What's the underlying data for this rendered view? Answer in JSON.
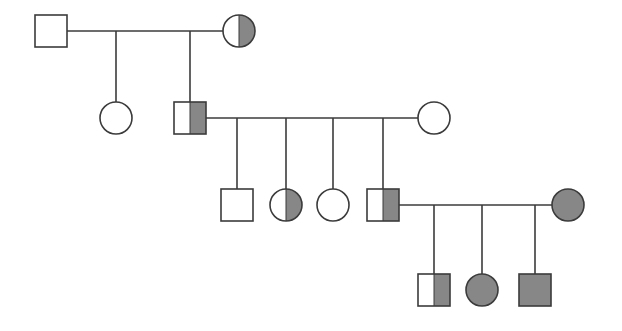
{
  "figure": {
    "kind": "pedigree-chart",
    "width": 622,
    "height": 331,
    "background_color": "#ffffff",
    "line_color": "#3b3b3b",
    "line_width": 1.6,
    "fill_color": "#878787",
    "unaffected_fill": "#ffffff"
  },
  "legend_semantics": {
    "square": "male",
    "circle": "female",
    "unfilled": "unaffected",
    "half_filled_right": "carrier / heterozygous",
    "fully_filled": "affected"
  },
  "generations": [
    {
      "id": "I",
      "symbol_y": 31,
      "members": [
        {
          "id": "I-1",
          "shape": "square",
          "fill": "none",
          "cx": 51,
          "cy": 31,
          "size": 32,
          "label": "unaffected-male"
        },
        {
          "id": "I-2",
          "shape": "circle",
          "fill": "half-right",
          "cx": 239,
          "cy": 31,
          "size": 32,
          "label": "carrier-female"
        }
      ]
    },
    {
      "id": "II",
      "symbol_y": 118,
      "members": [
        {
          "id": "II-1",
          "shape": "circle",
          "fill": "none",
          "cx": 116,
          "cy": 118,
          "size": 32,
          "label": "unaffected-female"
        },
        {
          "id": "II-2",
          "shape": "square",
          "fill": "half-right",
          "cx": 190,
          "cy": 118,
          "size": 32,
          "label": "carrier-male"
        },
        {
          "id": "II-3",
          "shape": "circle",
          "fill": "none",
          "cx": 434,
          "cy": 118,
          "size": 32,
          "label": "unaffected-female"
        }
      ]
    },
    {
      "id": "III",
      "symbol_y": 205,
      "members": [
        {
          "id": "III-1",
          "shape": "square",
          "fill": "none",
          "cx": 237,
          "cy": 205,
          "size": 32,
          "label": "unaffected-male"
        },
        {
          "id": "III-2",
          "shape": "circle",
          "fill": "half-right",
          "cx": 286,
          "cy": 205,
          "size": 32,
          "label": "carrier-female"
        },
        {
          "id": "III-3",
          "shape": "circle",
          "fill": "none",
          "cx": 333,
          "cy": 205,
          "size": 32,
          "label": "unaffected-female"
        },
        {
          "id": "III-4",
          "shape": "square",
          "fill": "half-right",
          "cx": 383,
          "cy": 205,
          "size": 32,
          "label": "carrier-male"
        },
        {
          "id": "III-5",
          "shape": "circle",
          "fill": "full",
          "cx": 568,
          "cy": 205,
          "size": 32,
          "label": "affected-female"
        }
      ]
    },
    {
      "id": "IV",
      "symbol_y": 290,
      "members": [
        {
          "id": "IV-1",
          "shape": "square",
          "fill": "half-right",
          "cx": 434,
          "cy": 290,
          "size": 32,
          "label": "carrier-male"
        },
        {
          "id": "IV-2",
          "shape": "circle",
          "fill": "full",
          "cx": 482,
          "cy": 290,
          "size": 32,
          "label": "affected-female"
        },
        {
          "id": "IV-3",
          "shape": "square",
          "fill": "full",
          "cx": 535,
          "cy": 290,
          "size": 32,
          "label": "affected-male"
        }
      ]
    }
  ],
  "matings": [
    {
      "id": "mating-I",
      "partners": [
        "I-1",
        "I-2"
      ],
      "line_y": 31,
      "x_start": 67,
      "x_end": 223,
      "children_drop_x": [
        116,
        190
      ],
      "children_y": 102
    },
    {
      "id": "mating-II",
      "partners": [
        "II-2",
        "II-3"
      ],
      "line_y": 118,
      "x_start": 206,
      "x_end": 418,
      "children_drop_x": [
        237,
        286,
        333,
        383
      ],
      "children_y": 189
    },
    {
      "id": "mating-III",
      "partners": [
        "III-4",
        "III-5"
      ],
      "line_y": 205,
      "x_start": 399,
      "x_end": 552,
      "children_drop_x": [
        434,
        482,
        535
      ],
      "children_y": 274
    }
  ]
}
